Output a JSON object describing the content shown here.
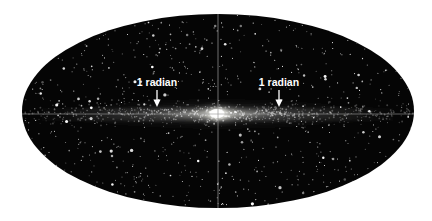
{
  "figure": {
    "name": "all-sky-star-map",
    "background_color": "#ffffff",
    "sky_color": "#050505",
    "star_color": "#ffffff",
    "gridline_color": "#9a9a9a"
  },
  "projection": {
    "type": "mollweide",
    "center_x": 218,
    "center_y": 111,
    "semi_axis_x": 196,
    "semi_axis_y": 97
  },
  "gridlines": {
    "meridian": {
      "name": "central-meridian",
      "orientation": "vertical",
      "x": 218,
      "color": "#9a9a9a"
    },
    "equator": {
      "name": "galactic-equator",
      "orientation": "horizontal",
      "y": 114,
      "color": "#9a9a9a"
    }
  },
  "annotations": [
    {
      "id": "left",
      "label": "1 radian",
      "label_x": 157,
      "label_y": 86,
      "arrow_x": 157,
      "arrow_top_y": 90,
      "arrow_bottom_y": 107,
      "color": "#ffffff"
    },
    {
      "id": "right",
      "label": "1 radian",
      "label_x": 279,
      "label_y": 86,
      "arrow_x": 279,
      "arrow_top_y": 90,
      "arrow_bottom_y": 107,
      "color": "#ffffff"
    }
  ],
  "chart_data": {
    "type": "scatter",
    "title": "",
    "xlabel": "",
    "ylabel": "",
    "projection": "mollweide",
    "xlim": [
      -180,
      180
    ],
    "ylim": [
      -90,
      90
    ],
    "grid": true,
    "legend": null,
    "annotations": [
      "1 radian",
      "1 radian"
    ],
    "features": [
      {
        "name": "galactic-disk",
        "description": "Bright horizontal band of stars along galactic latitude b = 0",
        "center": [
          0,
          0
        ],
        "extent_longitude": [
          -180,
          180
        ],
        "scale_height_deg": 4
      },
      {
        "name": "galactic-bulge",
        "description": "Bright central concentration at the galactic center",
        "center": [
          0,
          0
        ],
        "radius_deg": 10,
        "peak_brightness": 1.0
      },
      {
        "name": "halo-field-stars",
        "description": "Sparse resolved point sources scattered across the whole sky",
        "count": 900
      }
    ]
  }
}
